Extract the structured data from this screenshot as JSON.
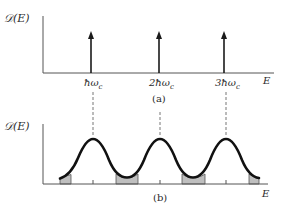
{
  "figure": {
    "panel_a": {
      "y_label": "𝒟(E)",
      "x_label": "E",
      "caption": "(a)",
      "tick_labels": [
        "ħω",
        "2ħω",
        "3ħω"
      ],
      "tick_subscript": "c",
      "arrow_count": 3
    },
    "panel_b": {
      "y_label": "𝒟(E)",
      "x_label": "E",
      "caption": "(b)",
      "peak_count": 3,
      "shaded_regions": 4
    },
    "colors": {
      "line": "#2a2a2a",
      "curve": "#111111",
      "shade": "#bfbfbf",
      "dash": "#777777"
    }
  }
}
